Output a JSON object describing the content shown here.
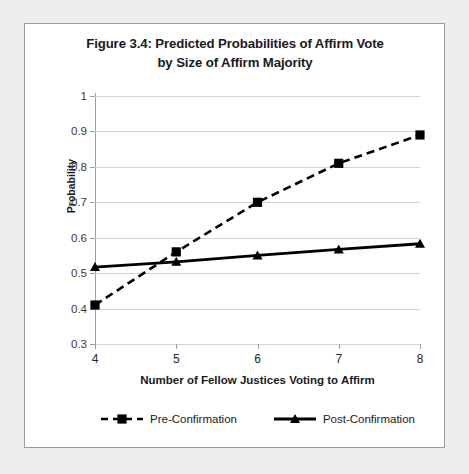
{
  "chart_data": {
    "type": "line",
    "title": "Figure 3.4: Predicted Probabilities of Affirm Vote by Size of Affirm Majority",
    "title_line1": "Figure 3.4: Predicted Probabilities of Affirm Vote",
    "title_line2": "by Size of Affirm Majority",
    "xlabel": "Number of Fellow Justices Voting to Affirm",
    "ylabel": "Probability",
    "x": [
      4,
      5,
      6,
      7,
      8
    ],
    "xtick_labels": [
      "4",
      "5",
      "6",
      "7",
      "8"
    ],
    "ytick_labels": [
      "0.3",
      "0.4",
      "0.5",
      "0.6",
      "0.7",
      "0.8",
      "0.9",
      "1"
    ],
    "ytick_values": [
      0.3,
      0.4,
      0.5,
      0.6,
      0.7,
      0.8,
      0.9,
      1
    ],
    "xlim": [
      4,
      8
    ],
    "ylim": [
      0.3,
      1
    ],
    "grid": "horizontal",
    "legend_position": "bottom",
    "series": [
      {
        "name": "Pre-Confirmation",
        "values": [
          0.41,
          0.56,
          0.7,
          0.81,
          0.89
        ],
        "line_style": "dashed",
        "marker": "square",
        "color": "#000000"
      },
      {
        "name": "Post-Confirmation",
        "values": [
          0.517,
          0.532,
          0.55,
          0.567,
          0.583
        ],
        "line_style": "solid",
        "marker": "triangle",
        "color": "#000000"
      }
    ]
  },
  "legend": {
    "items": [
      {
        "label": "Pre-Confirmation"
      },
      {
        "label": "Post-Confirmation"
      }
    ]
  }
}
